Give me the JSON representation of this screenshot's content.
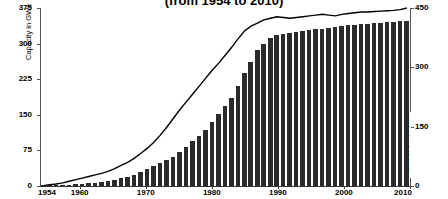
{
  "chart_data": {
    "type": "bar",
    "title": "(from 1954 to 2010)",
    "xlabel": "",
    "ylabel": "Capacity in GWe",
    "y2label": "Number of reactors",
    "ylim": [
      0,
      375
    ],
    "y2lim": [
      0,
      450
    ],
    "xlim": [
      1954,
      2010
    ],
    "yticks": [
      0,
      75,
      150,
      225,
      300,
      375
    ],
    "y2ticks": [
      0,
      150,
      300,
      450
    ],
    "xticks": [
      1954,
      1960,
      1970,
      1980,
      1990,
      2000,
      2010
    ],
    "grid": false,
    "legend": "none",
    "bar_color": "#2b2b2b",
    "line_color": "#000000",
    "categories": [
      1954,
      1955,
      1956,
      1957,
      1958,
      1959,
      1960,
      1961,
      1962,
      1963,
      1964,
      1965,
      1966,
      1967,
      1968,
      1969,
      1970,
      1971,
      1972,
      1973,
      1974,
      1975,
      1976,
      1977,
      1978,
      1979,
      1980,
      1981,
      1982,
      1983,
      1984,
      1985,
      1986,
      1987,
      1988,
      1989,
      1990,
      1991,
      1992,
      1993,
      1994,
      1995,
      1996,
      1997,
      1998,
      1999,
      2000,
      2001,
      2002,
      2003,
      2004,
      2005,
      2006,
      2007,
      2008,
      2009,
      2010
    ],
    "series": [
      {
        "name": "Capacity in GWe",
        "axis": "left",
        "type": "bar",
        "values": [
          0,
          1,
          2,
          2,
          3,
          4,
          5,
          6,
          7,
          9,
          11,
          13,
          16,
          20,
          24,
          29,
          35,
          42,
          48,
          55,
          62,
          72,
          82,
          95,
          106,
          118,
          135,
          152,
          168,
          186,
          210,
          238,
          262,
          286,
          300,
          312,
          318,
          320,
          322,
          324,
          326,
          328,
          330,
          331,
          332,
          335,
          338,
          340,
          340,
          341,
          342,
          343,
          344,
          345,
          346,
          347,
          348
        ]
      },
      {
        "name": "Number of reactors",
        "axis": "right",
        "type": "line",
        "values": [
          1,
          3,
          5,
          8,
          12,
          16,
          20,
          24,
          28,
          32,
          37,
          44,
          52,
          60,
          70,
          82,
          95,
          110,
          128,
          148,
          170,
          192,
          212,
          232,
          252,
          272,
          292,
          310,
          330,
          350,
          372,
          392,
          404,
          412,
          420,
          424,
          428,
          426,
          424,
          426,
          428,
          430,
          432,
          434,
          432,
          430,
          434,
          436,
          438,
          440,
          440,
          441,
          442,
          443,
          444,
          446,
          450
        ]
      }
    ]
  },
  "axes": {
    "left_ticks": [
      "375",
      "300",
      "225",
      "150",
      "75",
      "0"
    ],
    "right_ticks": [
      "450",
      "300",
      "150",
      "0"
    ],
    "x_ticks": [
      "1954",
      "1960",
      "1970",
      "1980",
      "1990",
      "2000",
      "2010"
    ],
    "left_label": "Capacity in GWe",
    "right_label": "Number of reactors"
  }
}
